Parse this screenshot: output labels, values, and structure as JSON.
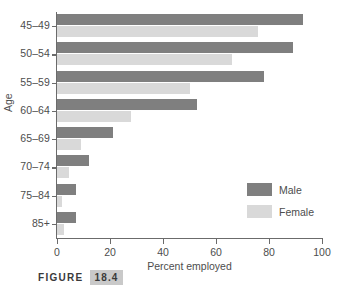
{
  "figure": {
    "caption_word": "FIGURE",
    "caption_number": "18.4"
  },
  "colors": {
    "male": "#7f7f7f",
    "female": "#d9d9d9",
    "axis": "#6b6b6b",
    "text": "#4d4d4d",
    "caption_highlight": "#c9c9c9"
  },
  "chart_data": {
    "type": "bar",
    "orientation": "horizontal",
    "title": "",
    "xlabel": "Percent employed",
    "ylabel": "Age",
    "xlim": [
      0,
      100
    ],
    "xticks": [
      0,
      20,
      40,
      60,
      80,
      100
    ],
    "xtick_labels": [
      "0",
      "20",
      "40",
      "60",
      "80",
      "100"
    ],
    "grid": false,
    "legend_position": "inside-right",
    "categories": [
      "45–49",
      "50–54",
      "55–59",
      "60–64",
      "65–69",
      "70–74",
      "75–84",
      "85+"
    ],
    "series": [
      {
        "name": "Male",
        "color": "#7f7f7f",
        "values": [
          93,
          89,
          78,
          53,
          21,
          12,
          7,
          7
        ]
      },
      {
        "name": "Female",
        "color": "#d9d9d9",
        "values": [
          76,
          66,
          50,
          28,
          9,
          4.5,
          2,
          2.5
        ]
      }
    ]
  }
}
